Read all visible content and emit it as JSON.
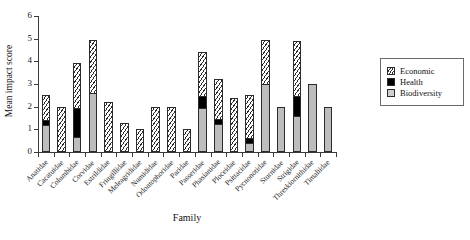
{
  "chart_data": {
    "type": "bar",
    "subtype": "stacked",
    "title": "",
    "xlabel": "Family",
    "ylabel": "Mean impact score",
    "ylim": [
      0,
      6
    ],
    "yticks": [
      0,
      1,
      2,
      3,
      4,
      5,
      6
    ],
    "grid": false,
    "legend_position": "right",
    "series": [
      {
        "name": "Economic",
        "pattern": "diagonal-hatch",
        "color": "#ffffff",
        "values": [
          1.15,
          2.0,
          2.0,
          2.4,
          2.2,
          1.3,
          1.0,
          2.0,
          2.0,
          1.0,
          2.0,
          1.8,
          2.4,
          1.95,
          2.0,
          0.0,
          2.5,
          0.0,
          0.0
        ]
      },
      {
        "name": "Health",
        "pattern": "solid",
        "color": "#000000",
        "values": [
          0.25,
          0.0,
          1.35,
          0.0,
          0.0,
          0.0,
          0.0,
          0.0,
          0.0,
          0.0,
          0.55,
          0.25,
          0.0,
          0.25,
          0.0,
          0.0,
          0.9,
          0.0,
          0.0
        ]
      },
      {
        "name": "Biodiversity",
        "pattern": "solid",
        "color": "#bdbdbd",
        "values": [
          1.2,
          0.0,
          0.65,
          2.6,
          0.0,
          0.0,
          0.0,
          0.0,
          0.0,
          0.0,
          1.95,
          1.25,
          0.0,
          0.4,
          3.0,
          2.0,
          1.6,
          3.0,
          2.0
        ]
      }
    ],
    "categories": [
      "Anatidae",
      "Cacatuidae",
      "Columbidae",
      "Corvidae",
      "Estrildidae",
      "Fringillidae",
      "Meleagrididae",
      "Numididae",
      "Odontophoridae",
      "Paridae",
      "Passeridae",
      "Phasianidae",
      "Ploceidae",
      "Psittacidae",
      "Pycnonotidae",
      "Sturnidae",
      "Strigidae",
      "Threskiornithidae",
      "Timaliidae"
    ],
    "totals": [
      2.6,
      2.0,
      4.0,
      5.0,
      2.2,
      1.3,
      1.0,
      2.0,
      2.0,
      1.0,
      4.5,
      3.3,
      2.4,
      2.6,
      5.0,
      2.0,
      5.0,
      3.0,
      2.0
    ]
  },
  "axes": {
    "y_title": "Mean impact score",
    "x_title": "Family",
    "y_tick_labels": [
      "0",
      "1",
      "2",
      "3",
      "4",
      "5",
      "6"
    ]
  },
  "legend": {
    "entries": [
      {
        "label": "Economic"
      },
      {
        "label": "Health"
      },
      {
        "label": "Biodiversity"
      }
    ]
  }
}
